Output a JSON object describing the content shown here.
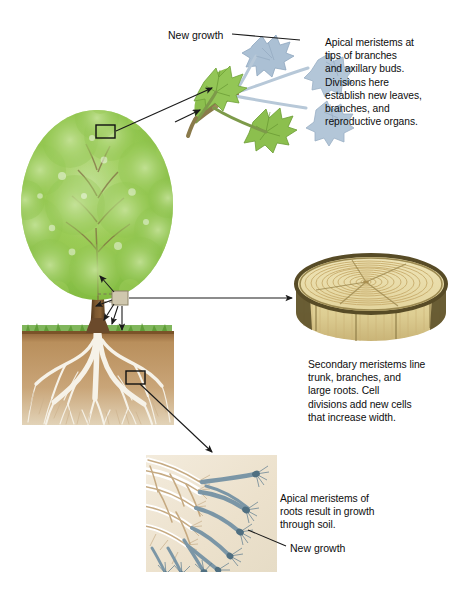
{
  "figure": {
    "background_color": "#ffffff"
  },
  "callouts": {
    "shoot_tip": {
      "text": "Apical meristems at\ntips of branches\nand axillary buds.\nDivisions here\nestablish new leaves,\nbranches, and\nreproductive organs."
    },
    "secondary": {
      "text": "Secondary meristems line\ntrunk, branches, and\nlarge roots. Cell\ndivisions add new cells\nthat increase width."
    },
    "root_tip": {
      "text": "Apical meristems of\nroots result in growth\nthrough soil."
    }
  },
  "labels": {
    "new_growth_top": "New growth",
    "new_growth_bottom": "New  growth"
  },
  "insets": {
    "branch_tip": {
      "name": "branch-tip-inset",
      "new_growth_color": "#9fb6cc",
      "mature_leaf_color": "#8cbf4e",
      "stem_color": "#9a8b57"
    },
    "cut_log": {
      "name": "cut-log-inset",
      "wood_color": "#e7dba4",
      "ring_color": "#c9b579",
      "bark_color": "#4e4428"
    },
    "root_tip": {
      "name": "root-tip-inset",
      "background_color": "#efe6d4",
      "mature_root_color": "#c6a97f",
      "new_growth_color": "#6f8b9b"
    }
  },
  "tree": {
    "name": "tree-illustration",
    "canopy_color": "#8cc34a",
    "canopy_light_color": "#bcdc90",
    "trunk_color": "#6b4a2b",
    "grass_color": "#63a83c",
    "soil_color": "#b08356",
    "root_color": "#f3efe4",
    "callout_box_canopy": "canopy-meristem-box",
    "callout_box_trunk": "trunk-meristem-box",
    "callout_box_root": "root-meristem-box"
  }
}
